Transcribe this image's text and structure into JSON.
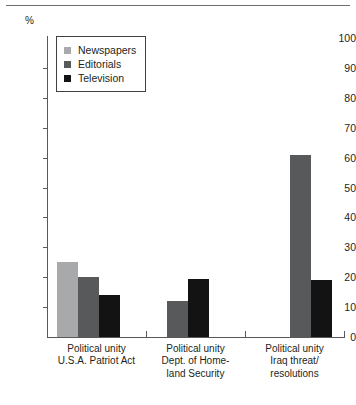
{
  "chart_data": {
    "type": "bar",
    "title": "",
    "subtitle": "",
    "xlabel": "",
    "ylabel": "%",
    "ylim": [
      0,
      100
    ],
    "ytick_step": 10,
    "yticks": [
      100,
      90,
      80,
      70,
      60,
      50,
      40,
      30,
      20,
      10,
      0
    ],
    "grid": false,
    "legend_position": "top-left",
    "categories": [
      "Political unity\nU.S.A. Patriot Act",
      "Political unity\nDept. of Home-\nland Security",
      "Political unity\nIraq threat/\nresolutions"
    ],
    "category_lines": [
      [
        "Political unity",
        "U.S.A. Patriot Act"
      ],
      [
        "Political unity",
        "Dept. of Home-",
        "land Security"
      ],
      [
        "Political unity",
        "Iraq threat/",
        "resolutions"
      ]
    ],
    "series": [
      {
        "name": "Newspapers",
        "color": "#a7a9ab",
        "values": [
          25,
          null,
          null
        ]
      },
      {
        "name": "Editorials",
        "color": "#58595b",
        "values": [
          20,
          12,
          61
        ]
      },
      {
        "name": "Television",
        "color": "#131313",
        "values": [
          14,
          19.5,
          19
        ]
      }
    ]
  },
  "legend": {
    "items": [
      {
        "label": "Newspapers",
        "color": "#a7a9ab"
      },
      {
        "label": "Editorials",
        "color": "#58595b"
      },
      {
        "label": "Television",
        "color": "#131313"
      }
    ]
  },
  "axis": {
    "unit_label": "%",
    "tick_labels": [
      "100",
      "90",
      "80",
      "70",
      "60",
      "50",
      "40",
      "30",
      "20",
      "10",
      "0"
    ]
  }
}
